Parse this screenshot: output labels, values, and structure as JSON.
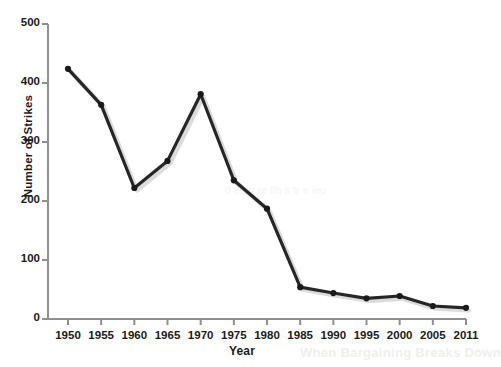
{
  "chart_data": {
    "type": "line",
    "title": "",
    "xlabel": "Year",
    "ylabel": "Number of Strikes",
    "x": [
      "1950",
      "1955",
      "1960",
      "1965",
      "1970",
      "1975",
      "1980",
      "1985",
      "1990",
      "1995",
      "2000",
      "2005",
      "2011"
    ],
    "categories": [
      "1950",
      "1955",
      "1960",
      "1965",
      "1970",
      "1975",
      "1980",
      "1985",
      "1990",
      "1995",
      "2000",
      "2005",
      "2011"
    ],
    "values": [
      424,
      363,
      222,
      268,
      381,
      235,
      187,
      54,
      44,
      35,
      39,
      22,
      19
    ],
    "series": [
      {
        "name": "Number of Strikes",
        "values": [
          424,
          363,
          222,
          268,
          381,
          235,
          187,
          54,
          44,
          35,
          39,
          22,
          19
        ]
      }
    ],
    "ylim": [
      0,
      500
    ],
    "yticks": [
      0,
      100,
      200,
      300,
      400,
      500
    ],
    "ytick_labels": [
      "0",
      "100",
      "200",
      "300",
      "400",
      "500"
    ],
    "xtick_labels": [
      "1950",
      "1955",
      "1960",
      "1965",
      "1970",
      "1975",
      "1980",
      "1985",
      "1990",
      "1995",
      "2000",
      "2005",
      "2011"
    ],
    "grid": false,
    "legend": false,
    "legend_position": "none",
    "marker": "circle",
    "line_color": "#262626",
    "marker_color": "#1a1a1a",
    "axis_color": "#8f8f8f",
    "background_color": "#ffffff"
  },
  "background_bleed": {
    "middle": "d ee  n   re     fih s   tr e    ieu",
    "bottom": "When Bargaining Breaks Down"
  }
}
